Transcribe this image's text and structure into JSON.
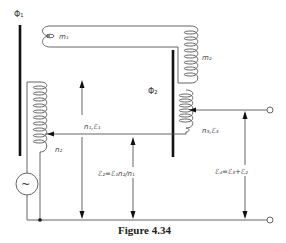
{
  "figure": {
    "caption": "Figure 4.34",
    "labels": {
      "phi1": "Φ₁",
      "phi2": "Φ₂",
      "m1": "m₁",
      "m2": "m₂",
      "n1_e1": "n₁,ℰ₁",
      "n2": "n₂",
      "n3_e3": "n₃,ℰ₃",
      "e2_eq": "ℰ₂=ℰ₁n₂/n₁",
      "e4_eq": "ℰ₄=ℰ₃+ℰ₂"
    },
    "components": {
      "source": "ac-voltage-source",
      "terminals": [
        "output-terminal-top",
        "output-terminal-bottom"
      ],
      "cores": [
        "core-phi1",
        "core-phi2"
      ],
      "coils": [
        "coil-m1",
        "coil-m2",
        "coil-n1-n2",
        "coil-n3"
      ]
    },
    "colors": {
      "line": "#555555",
      "core": "#111111",
      "text": "#444444"
    }
  }
}
